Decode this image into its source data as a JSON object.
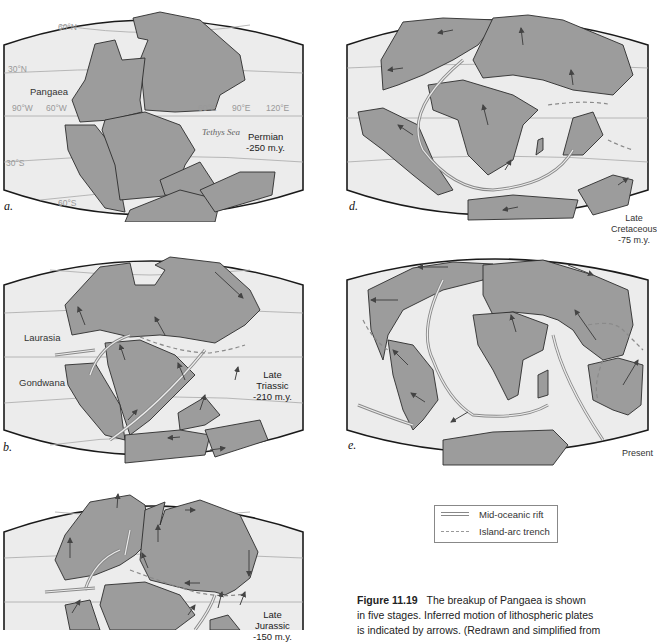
{
  "figure": {
    "number": "Figure 11.19",
    "caption_lines": [
      "The breakup of Pangaea is shown",
      "in five stages. Inferred motion of lithospheric plates",
      "is indicated by arrows. (Redrawn and simplified from"
    ]
  },
  "panels": {
    "a": {
      "letter": "a.",
      "stage": "Permian",
      "age": "-250 m.y.",
      "landmass_label": "Pangaea",
      "sea_label": "Tethys Sea",
      "latitudes": [
        "60°N",
        "30°N",
        "30°S",
        "60°S"
      ],
      "longitudes": [
        "90°W",
        "60°W",
        "60°E",
        "90°E",
        "120°E"
      ]
    },
    "b": {
      "letter": "b.",
      "stage_line1": "Late",
      "stage_line2": "Triassic",
      "age": "-210 m.y.",
      "north_label": "Laurasia",
      "south_label": "Gondwana"
    },
    "c": {
      "stage_line1": "Late",
      "stage_line2": "Jurassic",
      "age": "-150 m.y."
    },
    "d": {
      "letter": "d.",
      "stage_line1": "Late",
      "stage_line2": "Cretaceous",
      "age": "-75 m.y."
    },
    "e": {
      "letter": "e.",
      "stage": "Present"
    }
  },
  "legend": {
    "items": [
      {
        "symbol": "double-line",
        "label": "Mid-oceanic rift"
      },
      {
        "symbol": "dashed-line",
        "label": "Island-arc trench"
      }
    ]
  }
}
